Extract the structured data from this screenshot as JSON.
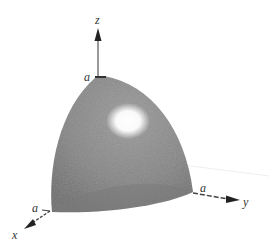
{
  "figure": {
    "axes": {
      "x": {
        "label": "x"
      },
      "y": {
        "label": "y"
      },
      "z": {
        "label": "z"
      }
    },
    "intercepts": {
      "x": "a",
      "y": "a",
      "z": "a"
    },
    "colors": {
      "surface": "#8a8a8a",
      "surface_dark": "#6f6f6f",
      "highlight": "#ffffff",
      "axis": "#555555",
      "arrow": "#222222"
    }
  }
}
